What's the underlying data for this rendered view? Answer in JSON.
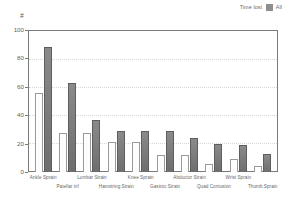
{
  "chart_data": {
    "type": "bar",
    "title": "",
    "subtitle": "",
    "xlabel": "",
    "ylabel": "#",
    "ylim": [
      0,
      100
    ],
    "yticks": [
      0,
      20,
      40,
      60,
      80,
      100
    ],
    "grid": true,
    "legend_position": "top-right",
    "categories": [
      "Ankle Sprain",
      "Patellar inf",
      "Lumbar Strain",
      "Hamstring Strain",
      "Knee Sprain",
      "Gastroc Strain",
      "Abductor Strain",
      "Quad Contusion",
      "Wrist Sprain",
      "Thumb Sprain"
    ],
    "series": [
      {
        "name": "Time lost",
        "color": "#ffffff",
        "values": [
          56,
          28,
          28,
          21,
          21,
          12,
          12,
          6,
          9,
          4
        ]
      },
      {
        "name": "All",
        "color": "#7d7d7d",
        "values": [
          89,
          63,
          37,
          29,
          29,
          29,
          24,
          20,
          19,
          13
        ]
      }
    ]
  },
  "legend": {
    "entries": [
      {
        "label": "Time lost",
        "swatch": "legend-swatch-timelost"
      },
      {
        "label": "All",
        "swatch": "legend-swatch-all"
      }
    ]
  },
  "axis": {
    "unit_label": "#",
    "tick_labels": [
      "100",
      "80",
      "60",
      "40",
      "20",
      "0"
    ]
  }
}
